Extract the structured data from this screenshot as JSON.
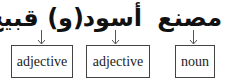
{
  "items": [
    {
      "word": "(و) قبيح",
      "label": "adjective"
    },
    {
      "word": "أسود",
      "label": "adjective"
    },
    {
      "word": "مصنع",
      "label": "noun"
    }
  ]
}
